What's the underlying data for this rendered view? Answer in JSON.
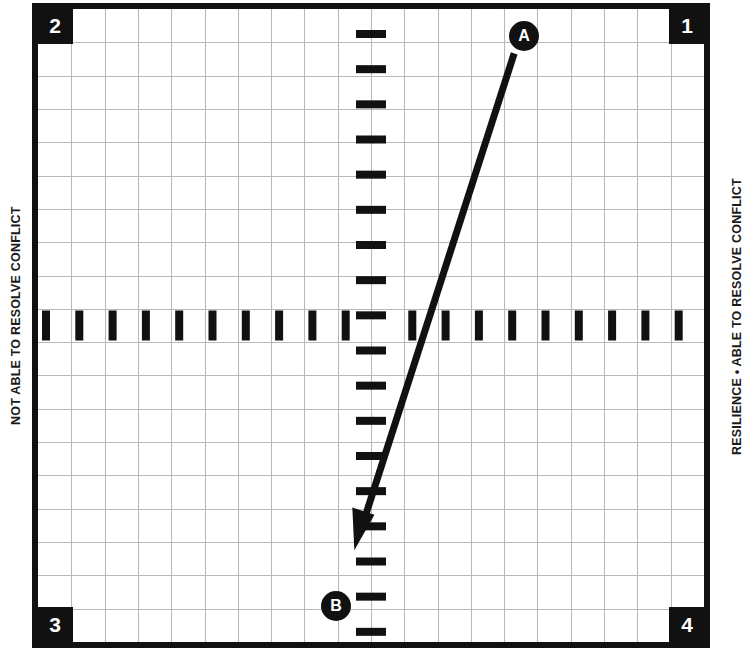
{
  "chart_data": {
    "type": "scatter",
    "title": "",
    "subtitle": "",
    "xlabel": "",
    "ylabel": "",
    "grid": true,
    "legend_position": "none",
    "axis_style": "dashed-crosshair",
    "xlim": [
      -10,
      10
    ],
    "ylim": [
      -10,
      10
    ],
    "quadrant_labels": [
      "1",
      "2",
      "3",
      "4"
    ],
    "quadrants": [
      {
        "id": "1",
        "position": "top-right"
      },
      {
        "id": "2",
        "position": "top-left"
      },
      {
        "id": "3",
        "position": "bottom-left"
      },
      {
        "id": "4",
        "position": "bottom-right"
      }
    ],
    "left_axis_caption": "NOT ABLE TO RESOLVE CONFLICT",
    "right_axis_caption": "RESILIENCE • ABLE TO RESOLVE CONFLICT",
    "points": [
      {
        "label": "A",
        "x": 4.6,
        "y": 9.1
      },
      {
        "label": "B",
        "x": -1.1,
        "y": -8.1
      }
    ],
    "annotations": [
      {
        "type": "arrow",
        "from": "A",
        "to": "B",
        "from_xy": [
          4.3,
          8.6
        ],
        "to_xy": [
          -0.5,
          -7.1
        ],
        "direction": "A-to-B"
      }
    ],
    "grid_cells_x": 20,
    "grid_cells_y": 19,
    "vertical_axis_ticks": 18,
    "horizontal_axis_ticks": 20
  },
  "captions": {
    "left": "NOT ABLE TO RESOLVE CONFLICT",
    "right": "RESILIENCE • ABLE TO RESOLVE CONFLICT"
  },
  "quadrants": {
    "top_left": "2",
    "top_right": "1",
    "bottom_left": "3",
    "bottom_right": "4"
  },
  "markers": {
    "a": "A",
    "b": "B"
  },
  "colors": {
    "ink": "#111111",
    "grid_line": "#b9b9b9",
    "paper": "#ffffff"
  }
}
